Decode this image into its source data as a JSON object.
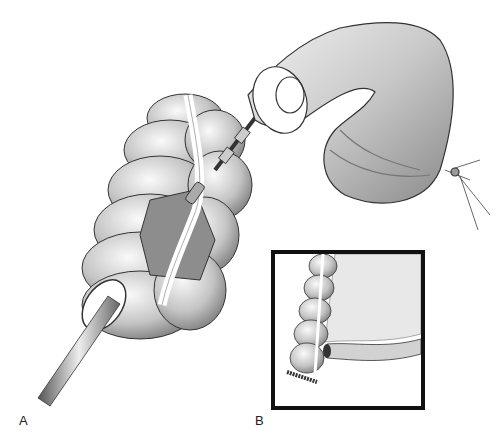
{
  "figure": {
    "panels": [
      {
        "id": "A",
        "label": "A",
        "description": "Colon segment with tube inserted and stapler anvil advancing through lumen"
      },
      {
        "id": "B",
        "label": "B",
        "description": "Inset: end-to-side anastomosis of ileum to colon with stapled closed end"
      }
    ],
    "colors": {
      "background": "#ffffff",
      "ink": "#111111",
      "shade_dark": "#7a7a7a",
      "shade_mid": "#b5b5b5",
      "shade_light": "#e4e4e4"
    }
  }
}
